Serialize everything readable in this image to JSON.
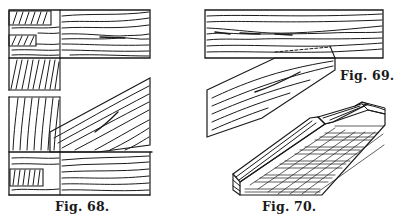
{
  "figures": [
    {
      "id": "fig68",
      "caption": "Fig. 68.",
      "description": "Mortise-and-tenon joints: horizontal board with tenons into end-grain post (top) and oblique brace meeting post and sill (bottom)"
    },
    {
      "id": "fig69",
      "caption": "Fig. 69.",
      "description": "Oblique strut notched into underside of a horizontal beam"
    },
    {
      "id": "fig70",
      "caption": "Fig. 70.",
      "description": "Perspective view of a beam end showing bevelled notch/shoulder with cross-hatched end grain"
    }
  ],
  "colors": {
    "ink": "#1a1a1a",
    "paper": "#ffffff"
  }
}
